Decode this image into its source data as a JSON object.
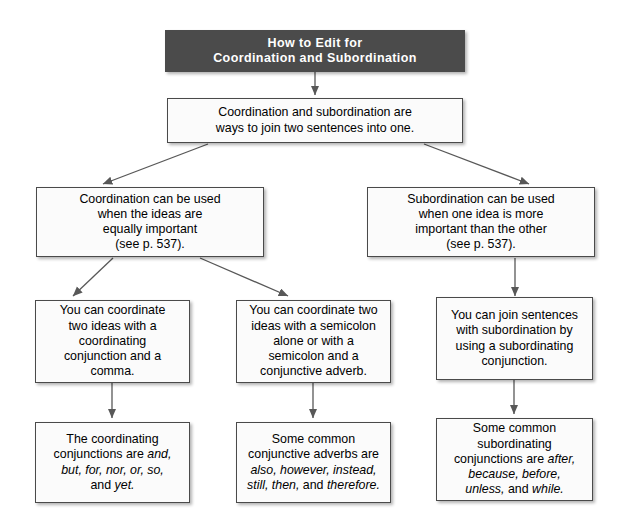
{
  "diagram": {
    "title_box": {
      "id": "title-box",
      "line1": "How to Edit for",
      "line2": "Coordination and Subordination",
      "bg": "#4b4b4b",
      "fg": "#ffffff"
    },
    "boxes": [
      {
        "id": "intro",
        "lines": [
          "Coordination and subordination are",
          "ways to join two sentences into one."
        ]
      },
      {
        "id": "coordination-rule",
        "lines": [
          "Coordination can be used",
          "when the ideas are",
          "equally important",
          "(see p. 537)."
        ]
      },
      {
        "id": "subordination-rule",
        "lines": [
          "Subordination can be used",
          "when one idea is more",
          "important than the other",
          "(see p. 537)."
        ]
      },
      {
        "id": "coordinate-conjunction",
        "lines": [
          "You can coordinate",
          "two ideas with a",
          "coordinating",
          "conjunction and a",
          "comma."
        ]
      },
      {
        "id": "coordinate-semicolon",
        "lines": [
          "You can coordinate two",
          "ideas with a semicolon",
          "alone or with a",
          "semicolon and a",
          "conjunctive adverb."
        ]
      },
      {
        "id": "join-subordination",
        "lines": [
          "You can join sentences",
          "with subordination by",
          "using a subordinating",
          "conjunction."
        ]
      },
      {
        "id": "coordinating-conjunctions-list",
        "html": "The coordinating<br>conjunctions are <em>and,</em><br><em>but, for, nor, or, so,</em><br>and <em>yet.</em>"
      },
      {
        "id": "conjunctive-adverbs-list",
        "html": "Some common<br>conjunctive adverbs are<br><em>also, however, instead,</em><br><em>still, then,</em> and <em>therefore.</em>"
      },
      {
        "id": "subordinating-conjunctions-list",
        "html": "Some common<br>subordinating<br>conjunctions are <em>after,</em><br><em>because, before,</em><br><em>unless,</em> and <em>while.</em>"
      }
    ],
    "connector_color": "#585858"
  }
}
